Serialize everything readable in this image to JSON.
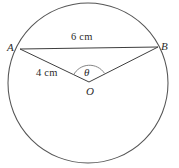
{
  "figure": {
    "kind": "circle-geometry-diagram",
    "background_color": "#ffffff",
    "stroke_color": "#3f3f3f",
    "circle": {
      "center_label": "O",
      "center_x": 88,
      "center_y": 83,
      "radius_px": 80
    },
    "points": {
      "a_label": "A",
      "a_x": 20,
      "a_y": 49,
      "b_label": "B",
      "b_x": 158,
      "b_y": 47,
      "o_label": "O",
      "o_x": 89,
      "o_y": 82
    },
    "angle": {
      "symbol": "θ",
      "vertex": "O"
    },
    "measures": {
      "chord_label": "6 cm",
      "radius_label": "4 cm"
    }
  }
}
